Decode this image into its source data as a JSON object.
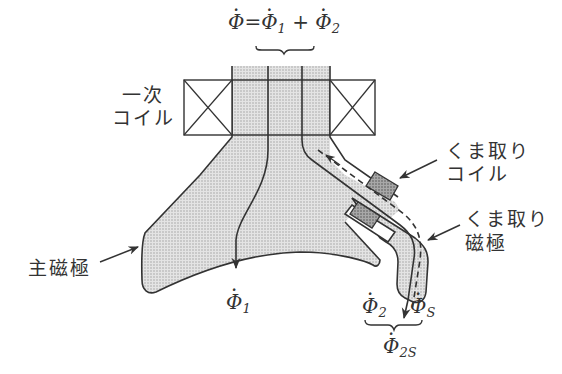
{
  "diagram": {
    "title_equation": {
      "lhs": "Φ",
      "equals": "=",
      "term1": "Φ",
      "term1_sub": "1",
      "plus": "+",
      "term2": "Φ",
      "term2_sub": "2"
    },
    "labels": {
      "primary_coil_line1": "一次",
      "primary_coil_line2": "コイル",
      "shading_coil_line1": "くま取り",
      "shading_coil_line2": "コイル",
      "shading_pole_line1": "くま取り",
      "shading_pole_line2": "磁極",
      "main_pole": "主磁極"
    },
    "flux_labels": {
      "phi1": "Φ",
      "phi1_sub": "1",
      "phi2": "Φ",
      "phi2_sub": "2",
      "phis": "Φ",
      "phis_sub": "S",
      "phi2s": "Φ",
      "phi2s_sub": "2S"
    },
    "colors": {
      "stroke": "#333333",
      "core_fill": "#d9d9d9",
      "coil_fill": "#9a9a9a",
      "background": "#ffffff"
    }
  }
}
